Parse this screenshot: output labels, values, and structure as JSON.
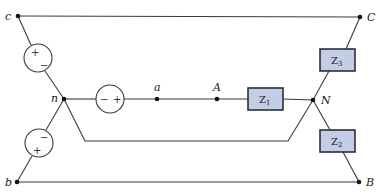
{
  "diagram": {
    "type": "three-phase Y-Y circuit",
    "source_nodes": {
      "c": "c",
      "n": "n",
      "b": "b",
      "a": "a"
    },
    "load_nodes": {
      "C": "C",
      "A": "A",
      "N": "N",
      "B": "B"
    },
    "impedances": {
      "z1": {
        "main": "Z",
        "sub": "1"
      },
      "z2": {
        "main": "Z",
        "sub": "2"
      },
      "z3": {
        "main": "Z",
        "sub": "3"
      }
    },
    "sources": {
      "cn": {
        "plus": "+",
        "minus": "−"
      },
      "an": {
        "plus": "+",
        "minus": "−"
      },
      "bn": {
        "plus": "+",
        "minus": "−"
      }
    },
    "colors": {
      "impedance_fill": "#c3cde6",
      "impedance_border": "#2d2d3a",
      "wire": "#3a3a3a"
    }
  }
}
